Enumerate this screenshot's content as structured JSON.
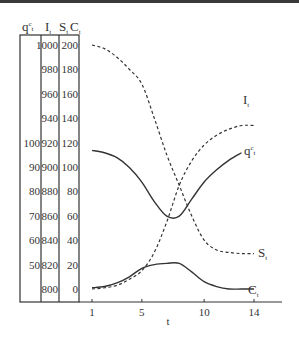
{
  "chart_data": {
    "type": "line",
    "title": "",
    "xlabel": "t",
    "x_ticks": [
      1,
      5,
      10,
      14
    ],
    "xlim": [
      1,
      14
    ],
    "y_axes": [
      {
        "name": "qct",
        "label": "q^c_t",
        "ticks": [
          50,
          60,
          70,
          80,
          90,
          100
        ]
      },
      {
        "name": "It",
        "label": "I_t",
        "ticks": [
          800,
          820,
          840,
          860,
          880,
          900,
          920,
          940,
          960,
          980,
          1000
        ]
      },
      {
        "name": "StCt",
        "label": "S_t C_t",
        "ticks": [
          0,
          20,
          40,
          60,
          80,
          100,
          120,
          140,
          160,
          180,
          200
        ]
      }
    ],
    "grid": false,
    "legend": "inline labels at line ends",
    "series": [
      {
        "name": "I_t",
        "axis": "It",
        "style": "dashed",
        "x": [
          1,
          2,
          3,
          4,
          5,
          6,
          7,
          8,
          9,
          10,
          11,
          12,
          13,
          14
        ],
        "values": [
          800,
          801,
          803,
          808,
          815,
          830,
          855,
          885,
          905,
          918,
          926,
          931,
          934,
          934
        ]
      },
      {
        "name": "S_t",
        "axis": "StCt",
        "style": "dashed",
        "x": [
          1,
          2,
          3,
          4,
          5,
          6,
          7,
          8,
          9,
          10,
          11,
          12,
          13,
          14
        ],
        "values": [
          200,
          197,
          190,
          180,
          168,
          140,
          110,
          85,
          60,
          40,
          32,
          30,
          29,
          29
        ]
      },
      {
        "name": "q^c_t",
        "axis": "qct",
        "style": "solid",
        "x": [
          1,
          2,
          3,
          4,
          5,
          6,
          7,
          8,
          9,
          10,
          11,
          12,
          13
        ],
        "values": [
          97,
          96,
          94,
          90,
          84,
          76,
          70,
          70,
          77,
          84,
          89,
          93,
          96
        ]
      },
      {
        "name": "C_t",
        "axis": "StCt",
        "style": "solid",
        "x": [
          1,
          2,
          3,
          4,
          5,
          6,
          7,
          8,
          9,
          10,
          11,
          12,
          13,
          14
        ],
        "values": [
          1,
          2,
          5,
          10,
          17,
          20,
          21,
          21,
          14,
          6,
          2,
          0,
          0,
          0
        ]
      }
    ]
  },
  "table": {
    "headers": {
      "q": "q",
      "q_sup": "c",
      "q_sub": "t",
      "I": "I",
      "I_sub": "t",
      "S": "S",
      "S_sub": "t",
      "C": "C",
      "C_sub": "t"
    },
    "rows": [
      {
        "q": "",
        "I": "1000",
        "S": "200"
      },
      {
        "q": "",
        "I": "980",
        "S": "180"
      },
      {
        "q": "",
        "I": "960",
        "S": "160"
      },
      {
        "q": "",
        "I": "940",
        "S": "140"
      },
      {
        "q": "100",
        "I": "920",
        "S": "120"
      },
      {
        "q": "90",
        "I": "900",
        "S": "100"
      },
      {
        "q": "80",
        "I": "880",
        "S": "80"
      },
      {
        "q": "70",
        "I": "860",
        "S": "60"
      },
      {
        "q": "60",
        "I": "840",
        "S": "40"
      },
      {
        "q": "50",
        "I": "820",
        "S": "20"
      },
      {
        "q": "",
        "I": "800",
        "S": "0"
      }
    ]
  },
  "x_axis": {
    "ticks": [
      "1",
      "5",
      "10",
      "14"
    ],
    "label": "t"
  },
  "labels": {
    "I": {
      "main": "I",
      "sub": "t"
    },
    "q": {
      "main": "q",
      "sup": "c",
      "sub": "t"
    },
    "S": {
      "main": "S",
      "sub": "t"
    },
    "C": {
      "main": "C",
      "sub": "t"
    }
  },
  "colors": {
    "line": "#333333",
    "background": "#ffffff",
    "topbar": "#3a3a3a"
  }
}
